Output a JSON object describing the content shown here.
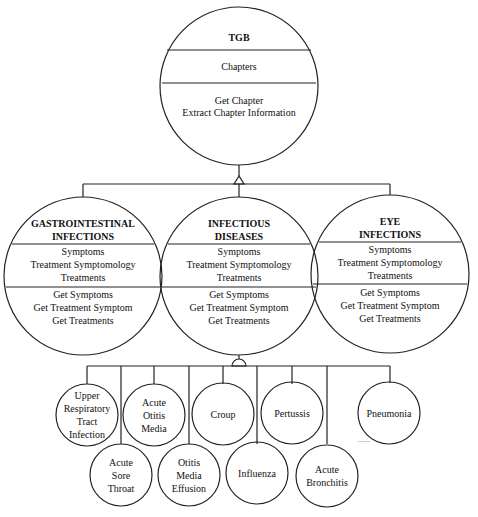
{
  "root": {
    "name": "TGB",
    "attributes": [
      "Chapters"
    ],
    "operations": [
      "Get Chapter",
      "Extract Chapter Information"
    ]
  },
  "chapters": [
    {
      "name_line1": "GASTROINTESTINAL",
      "name_line2": "INFECTIONS",
      "attributes": [
        "Symptoms",
        "Treatment Symptomology",
        "Treatments"
      ],
      "operations": [
        "Get Symptoms",
        "Get Treatment Symptom",
        "Get Treatments"
      ]
    },
    {
      "name_line1": "INFECTIOUS",
      "name_line2": "DISEASES",
      "attributes": [
        "Symptoms",
        "Treatment Symptomology",
        "Treatments"
      ],
      "operations": [
        "Get Symptoms",
        "Get Treatment Symptom",
        "Get Treatments"
      ]
    },
    {
      "name_line1": "EYE",
      "name_line2": "INFECTIONS",
      "attributes": [
        "Symptoms",
        "Treatment Symptomology",
        "Treatments"
      ],
      "operations": [
        "Get Symptoms",
        "Get Treatment Symptom",
        "Get Treatments"
      ]
    }
  ],
  "diseases": [
    {
      "lines": [
        "Upper",
        "Respiratory",
        "Tract",
        "Infection"
      ]
    },
    {
      "lines": [
        "Acute",
        "Sore",
        "Throat"
      ]
    },
    {
      "lines": [
        "Acute",
        "Otitis",
        "Media"
      ]
    },
    {
      "lines": [
        "Otitis",
        "Media",
        "Effusion"
      ]
    },
    {
      "lines": [
        "Croup"
      ]
    },
    {
      "lines": [
        "Influenza"
      ]
    },
    {
      "lines": [
        "Pertussis"
      ]
    },
    {
      "lines": [
        "Acute",
        "Bronchitis"
      ]
    },
    {
      "lines": [
        "Pneumonia"
      ]
    }
  ],
  "continuation": "......"
}
